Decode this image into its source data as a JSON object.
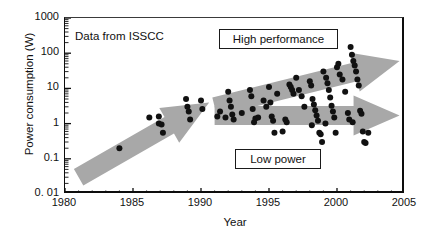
{
  "figure": {
    "note": "Data from ISSCC",
    "arrow_color": "#a8a8a8",
    "point_color": "#111111",
    "axis_color": "#0d0d0d"
  },
  "annotations": [
    {
      "id": "high-performance",
      "label": "High performance"
    },
    {
      "id": "low-power",
      "label": "Low power"
    }
  ],
  "chart_data": {
    "type": "scatter",
    "title": "",
    "subtitle": "",
    "xlabel": "Year",
    "ylabel": "Power consumption (W)",
    "xlim": [
      1980,
      2005
    ],
    "ylim": [
      0.01,
      1000
    ],
    "yscale": "log",
    "xscale": "linear",
    "grid": false,
    "legend": "none",
    "xticks": [
      1980,
      1985,
      1990,
      1995,
      2000,
      2005
    ],
    "xtick_labels": [
      "1980",
      "1985",
      "1990",
      "1995",
      "2000",
      "2005"
    ],
    "xminor_step": 1,
    "yticks": [
      0.01,
      0.1,
      1,
      10,
      100,
      1000
    ],
    "ytick_labels": [
      "0. 01",
      "0.1",
      "1",
      "10",
      "100",
      "1000"
    ],
    "annotations": [
      {
        "text": "Data from ISSCC",
        "x": 1980.6,
        "y": 420
      },
      {
        "text": "High performance",
        "x": 1991.8,
        "y": 330,
        "boxed": true
      },
      {
        "text": "Low power",
        "x": 1993.0,
        "y": 0.08,
        "boxed": true
      }
    ],
    "arrows": [
      {
        "name": "overall-trend-arrow",
        "from": [
          1981.0,
          0.03
        ],
        "to": [
          1990.6,
          4.0
        ],
        "color": "#a8a8a8"
      },
      {
        "name": "high-performance-arrow",
        "from": [
          1991.0,
          3.0
        ],
        "to": [
          2004.6,
          60.0
        ],
        "color": "#a8a8a8"
      },
      {
        "name": "low-power-arrow",
        "from": [
          1991.0,
          1.7
        ],
        "to": [
          2004.6,
          1.7
        ],
        "color": "#a8a8a8"
      }
    ],
    "series": [
      {
        "name": "Power consumption",
        "marker": "circle",
        "color": "#111111",
        "points": [
          [
            1984.0,
            0.2
          ],
          [
            1986.2,
            1.5
          ],
          [
            1986.9,
            1.6
          ],
          [
            1986.9,
            1.0
          ],
          [
            1987.1,
            0.95
          ],
          [
            1987.2,
            0.55
          ],
          [
            1988.9,
            5.0
          ],
          [
            1989.0,
            3.0
          ],
          [
            1989.1,
            2.2
          ],
          [
            1989.2,
            1.3
          ],
          [
            1990.0,
            4.5
          ],
          [
            1990.1,
            2.6
          ],
          [
            1991.4,
            2.2
          ],
          [
            1992.0,
            8.0
          ],
          [
            1992.1,
            4.5
          ],
          [
            1992.2,
            3.0
          ],
          [
            1992.3,
            1.8
          ],
          [
            1992.4,
            1.3
          ],
          [
            1993.6,
            9.0
          ],
          [
            1993.7,
            6.0
          ],
          [
            1993.8,
            2.6
          ],
          [
            1994.0,
            1.4
          ],
          [
            1994.6,
            4.5
          ],
          [
            1995.0,
            11.0
          ],
          [
            1995.1,
            4.0
          ],
          [
            1995.2,
            1.6
          ],
          [
            1995.3,
            1.2
          ],
          [
            1995.4,
            0.55
          ],
          [
            1996.0,
            0.6
          ],
          [
            1996.5,
            13.0
          ],
          [
            1996.6,
            11.0
          ],
          [
            1996.7,
            9.0
          ],
          [
            1996.8,
            7.0
          ],
          [
            1997.2,
            9.0
          ],
          [
            1997.4,
            6.0
          ],
          [
            1998.0,
            16.0
          ],
          [
            1998.1,
            12.0
          ],
          [
            1998.2,
            5.0
          ],
          [
            1998.3,
            3.5
          ],
          [
            1998.4,
            2.4
          ],
          [
            1998.5,
            1.7
          ],
          [
            1998.6,
            1.2
          ],
          [
            1998.7,
            0.55
          ],
          [
            1998.8,
            0.5
          ],
          [
            1998.9,
            0.3
          ],
          [
            1999.0,
            30.0
          ],
          [
            1999.2,
            20.0
          ],
          [
            1999.3,
            14.0
          ],
          [
            1999.4,
            9.0
          ],
          [
            1999.5,
            5.5
          ],
          [
            1999.6,
            3.2
          ],
          [
            1999.7,
            2.2
          ],
          [
            1999.8,
            1.5
          ],
          [
            1999.9,
            0.55
          ],
          [
            2000.0,
            40.0
          ],
          [
            2000.2,
            25.0
          ],
          [
            2000.4,
            18.0
          ],
          [
            2000.6,
            8.0
          ],
          [
            2000.8,
            2.0
          ],
          [
            2000.9,
            1.3
          ],
          [
            2001.0,
            150.0
          ],
          [
            2001.1,
            90.0
          ],
          [
            2001.2,
            60.0
          ],
          [
            2001.3,
            45.0
          ],
          [
            2001.4,
            30.0
          ],
          [
            2001.5,
            18.0
          ],
          [
            2001.6,
            12.0
          ],
          [
            2001.7,
            2.3
          ],
          [
            2001.8,
            1.9
          ],
          [
            2001.9,
            0.6
          ],
          [
            2002.0,
            0.3
          ],
          [
            2002.1,
            0.28
          ],
          [
            1997.0,
            20.0
          ],
          [
            1997.6,
            3.0
          ],
          [
            1994.2,
            1.5
          ],
          [
            1993.0,
            2.0
          ],
          [
            1991.8,
            1.5
          ],
          [
            1996.2,
            1.3
          ],
          [
            1996.3,
            1.1
          ],
          [
            2000.1,
            50.0
          ],
          [
            1995.6,
            7.0
          ],
          [
            1994.8,
            3.0
          ],
          [
            2002.3,
            0.55
          ],
          [
            1998.15,
            0.9
          ],
          [
            1999.15,
            1.0
          ],
          [
            2001.15,
            1.1
          ],
          [
            1993.9,
            1.1
          ],
          [
            1991.2,
            1.6
          ]
        ]
      }
    ]
  }
}
